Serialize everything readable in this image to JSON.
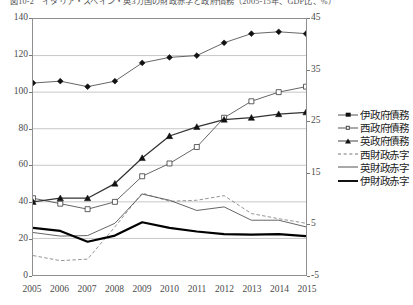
{
  "figure": {
    "title": "図10-2　イタリア・スペイン・英3カ国の財政赤字と政府債務（2005-15年、GDP比、%）"
  },
  "legend": {
    "items": [
      {
        "label": "伊政府債務",
        "marker": "diamond-filled",
        "line": "thin"
      },
      {
        "label": "西政府債務",
        "marker": "square-open",
        "line": "thin"
      },
      {
        "label": "英政府債務",
        "marker": "triangle-filled",
        "line": "mid"
      },
      {
        "label": "西財政赤字",
        "marker": "none",
        "line": "dashed"
      },
      {
        "label": "英財政赤字",
        "marker": "none",
        "line": "thin"
      },
      {
        "label": "伊財政赤字",
        "marker": "none",
        "line": "thick"
      }
    ]
  },
  "chart_data": {
    "type": "line",
    "title": "図10-2　イタリア・スペイン・英3カ国の財政赤字と政府債務（2005-15年、GDP比、%）",
    "xlabel": "",
    "ylabel": "",
    "grid": true,
    "legend_position": "right",
    "x": [
      2005,
      2006,
      2007,
      2008,
      2009,
      2010,
      2011,
      2012,
      2013,
      2014,
      2015
    ],
    "xtick_labels": [
      "2005",
      "2006",
      "2007",
      "2008",
      "2009",
      "2010",
      "2011",
      "2012",
      "2013",
      "2014",
      "2015"
    ],
    "left_axis": {
      "label": "政府債務（GDP比、%）",
      "ylim": [
        0,
        140
      ],
      "ticks": [
        0,
        20,
        40,
        60,
        80,
        100,
        120,
        140
      ],
      "tick_labels": [
        "0",
        "20",
        "40",
        "60",
        "80",
        "100",
        "120",
        "140"
      ]
    },
    "right_axis": {
      "label": "財政赤字（GDP比、%）",
      "ylim": [
        -5,
        45
      ],
      "ticks": [
        -5,
        5,
        15,
        25,
        35,
        45
      ],
      "tick_labels": [
        "-5",
        "5",
        "15",
        "25",
        "35",
        "45"
      ]
    },
    "series": [
      {
        "name": "伊政府債務",
        "axis": "left",
        "marker": "diamond-filled",
        "line": "thin",
        "values": [
          105,
          106,
          103,
          106,
          116,
          119,
          120,
          127,
          132,
          133,
          132
        ]
      },
      {
        "name": "西政府債務",
        "axis": "left",
        "marker": "square-open",
        "line": "thin",
        "values": [
          42,
          39,
          36,
          40,
          54,
          61,
          70,
          86,
          95,
          100,
          103
        ]
      },
      {
        "name": "英政府債務",
        "axis": "left",
        "marker": "triangle-filled",
        "line": "mid",
        "values": [
          40,
          42,
          42,
          50,
          64,
          76,
          81,
          85,
          86,
          88,
          89
        ]
      },
      {
        "name": "西財政赤字",
        "axis": "right",
        "marker": "none",
        "line": "dashed",
        "values": [
          -1.2,
          -2.2,
          -1.9,
          4.4,
          11.0,
          9.4,
          9.6,
          10.5,
          7.0,
          6.0,
          5.1
        ]
      },
      {
        "name": "英財政赤字",
        "axis": "right",
        "marker": "none",
        "line": "thin",
        "values": [
          3.3,
          2.6,
          2.7,
          5.1,
          10.8,
          9.6,
          7.6,
          8.3,
          5.7,
          5.7,
          4.4
        ]
      },
      {
        "name": "伊財政赤字",
        "axis": "right",
        "marker": "none",
        "line": "thick",
        "values": [
          4.2,
          3.6,
          1.5,
          2.7,
          5.3,
          4.2,
          3.5,
          3.0,
          2.9,
          3.0,
          2.6
        ]
      }
    ]
  }
}
